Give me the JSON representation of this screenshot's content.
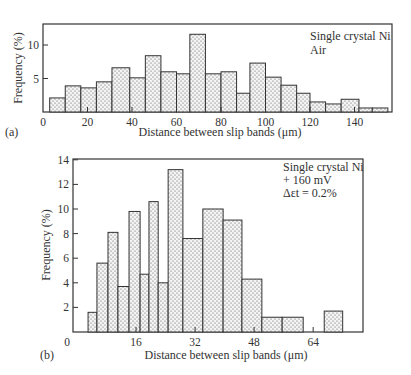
{
  "chart_data": [
    {
      "panel": "(a)",
      "type": "bar",
      "title": "",
      "annotation": [
        "Single crystal Ni",
        "Air"
      ],
      "xlabel": "Distance between slip bands (μm)",
      "ylabel": "Frequency (%)",
      "xlim": [
        0,
        155
      ],
      "ylim": [
        0,
        13
      ],
      "xticks": [
        0,
        20,
        40,
        60,
        80,
        100,
        120,
        140
      ],
      "yticks": [
        5,
        10
      ],
      "grid": false,
      "bins": [
        {
          "x0": 3,
          "x1": 10,
          "value": 2.1
        },
        {
          "x0": 10,
          "x1": 17,
          "value": 3.9
        },
        {
          "x0": 17,
          "x1": 24,
          "value": 3.6
        },
        {
          "x0": 24,
          "x1": 31,
          "value": 4.5
        },
        {
          "x0": 31,
          "x1": 39,
          "value": 6.6
        },
        {
          "x0": 39,
          "x1": 46,
          "value": 5.1
        },
        {
          "x0": 46,
          "x1": 53,
          "value": 8.4
        },
        {
          "x0": 53,
          "x1": 60,
          "value": 6.0
        },
        {
          "x0": 60,
          "x1": 66,
          "value": 5.7
        },
        {
          "x0": 66,
          "x1": 73,
          "value": 11.6
        },
        {
          "x0": 73,
          "x1": 80,
          "value": 5.7
        },
        {
          "x0": 80,
          "x1": 87,
          "value": 6.0
        },
        {
          "x0": 87,
          "x1": 93,
          "value": 2.8
        },
        {
          "x0": 93,
          "x1": 100,
          "value": 7.3
        },
        {
          "x0": 100,
          "x1": 107,
          "value": 5.2
        },
        {
          "x0": 107,
          "x1": 114,
          "value": 4.0
        },
        {
          "x0": 114,
          "x1": 120,
          "value": 2.8
        },
        {
          "x0": 120,
          "x1": 127,
          "value": 1.5
        },
        {
          "x0": 127,
          "x1": 134,
          "value": 1.2
        },
        {
          "x0": 134,
          "x1": 142,
          "value": 1.9
        },
        {
          "x0": 142,
          "x1": 148,
          "value": 0.6
        },
        {
          "x0": 148,
          "x1": 155,
          "value": 0.6
        }
      ]
    },
    {
      "panel": "(b)",
      "type": "bar",
      "title": "",
      "annotation": [
        "Single crystal Ni",
        "+ 160 mV",
        "Δεt = 0.2%"
      ],
      "xlabel": "Distance between slip bands (μm)",
      "ylabel": "Frequency (%)",
      "xlim": [
        0,
        78
      ],
      "ylim": [
        0,
        14
      ],
      "xticks": [
        0,
        16,
        32,
        48,
        64
      ],
      "yticks": [
        2,
        4,
        6,
        8,
        10,
        12,
        14
      ],
      "grid": false,
      "bins": [
        {
          "x0": 3.0,
          "x1": 5.4,
          "value": 1.6
        },
        {
          "x0": 5.4,
          "x1": 8.4,
          "value": 5.6
        },
        {
          "x0": 8.4,
          "x1": 11.1,
          "value": 8.1
        },
        {
          "x0": 11.1,
          "x1": 14.1,
          "value": 3.7
        },
        {
          "x0": 14.1,
          "x1": 17.1,
          "value": 9.8
        },
        {
          "x0": 17.1,
          "x1": 19.5,
          "value": 4.7
        },
        {
          "x0": 19.5,
          "x1": 22.0,
          "value": 10.6
        },
        {
          "x0": 22.0,
          "x1": 24.7,
          "value": 4.0
        },
        {
          "x0": 24.7,
          "x1": 28.7,
          "value": 13.2
        },
        {
          "x0": 28.7,
          "x1": 34.1,
          "value": 7.6
        },
        {
          "x0": 34.1,
          "x1": 39.6,
          "value": 10.0
        },
        {
          "x0": 39.6,
          "x1": 44.7,
          "value": 9.1
        },
        {
          "x0": 44.7,
          "x1": 50.1,
          "value": 4.3
        },
        {
          "x0": 50.1,
          "x1": 55.6,
          "value": 1.2
        },
        {
          "x0": 55.6,
          "x1": 61.3,
          "value": 1.2
        },
        {
          "x0": 67.0,
          "x1": 72.0,
          "value": 1.7
        }
      ]
    }
  ],
  "figure": {
    "panel_a_label": "(a)",
    "panel_b_label": "(b)"
  }
}
